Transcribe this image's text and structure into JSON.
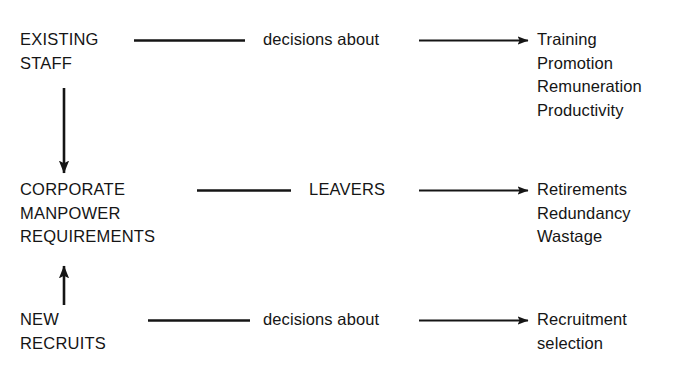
{
  "diagram": {
    "background_color": "#ffffff",
    "ink_color": "#151515",
    "rows": [
      {
        "id": "existing-staff",
        "left_label": "EXISTING\nSTAFF",
        "connector_label": "decisions about",
        "outcomes": "Training\nPromotion\nRemuneration\nProductivity"
      },
      {
        "id": "corporate-manpower",
        "left_label": "CORPORATE\nMANPOWER\nREQUIREMENTS",
        "connector_label": "LEAVERS",
        "outcomes": "Retirements\nRedundancy\nWastage"
      },
      {
        "id": "new-recruits",
        "left_label": "NEW\nRECRUITS",
        "connector_label": "decisions about",
        "outcomes": "Recruitment\nselection"
      }
    ],
    "connectors": {
      "vertical_down": "arrow from EXISTING STAFF down to CORPORATE MANPOWER REQUIREMENTS",
      "vertical_up": "arrow from NEW RECRUITS up to CORPORATE MANPOWER REQUIREMENTS",
      "plain_line": "plain connecting line",
      "arrow_line": "line with arrowhead"
    }
  }
}
